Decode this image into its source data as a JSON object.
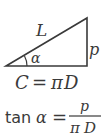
{
  "diagram": {
    "type": "right-triangle",
    "colors": {
      "stroke": "#3a3a3a",
      "background": "#ffffff"
    },
    "labels": {
      "hypotenuse": "L",
      "vertical_side": "p",
      "angle": "α"
    },
    "base_equation": {
      "lhs": "C",
      "eq": "=",
      "rhs_pi": "π",
      "rhs_d": "D"
    },
    "tan_equation": {
      "func": "tan",
      "angle": "α",
      "eq": "=",
      "numerator": "p",
      "denominator_pi": "π",
      "denominator_d": "D"
    }
  }
}
